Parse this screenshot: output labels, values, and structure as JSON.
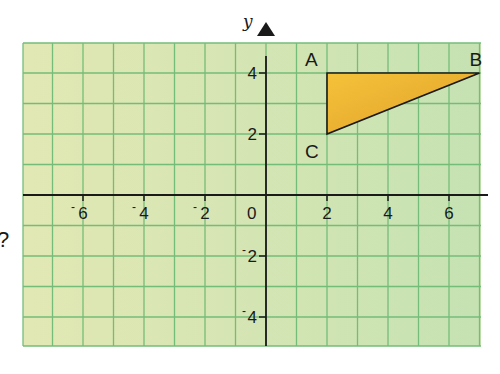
{
  "diagram": {
    "axis_label_y": "y",
    "margin_mark": "?",
    "x_ticks": [
      {
        "value": -6,
        "label": "6",
        "neg": true
      },
      {
        "value": -4,
        "label": "4",
        "neg": true
      },
      {
        "value": -2,
        "label": "2",
        "neg": true
      },
      {
        "value": 2,
        "label": "2",
        "neg": false
      },
      {
        "value": 4,
        "label": "4",
        "neg": false
      },
      {
        "value": 6,
        "label": "6",
        "neg": false
      }
    ],
    "y_ticks": [
      {
        "value": 4,
        "label": "4",
        "neg": false
      },
      {
        "value": 2,
        "label": "2",
        "neg": false
      },
      {
        "value": -2,
        "label": "2",
        "neg": true
      },
      {
        "value": -4,
        "label": "4",
        "neg": true
      }
    ],
    "origin_label": "0",
    "triangle": {
      "vertices": [
        {
          "name": "A",
          "x": 2,
          "y": 4
        },
        {
          "name": "B",
          "x": 7,
          "y": 4
        },
        {
          "name": "C",
          "x": 2,
          "y": 2
        }
      ],
      "fill": "#f0b830"
    },
    "grid": {
      "xmin": -8,
      "xmax": 7,
      "ymin": -5,
      "ymax": 5
    },
    "colors": {
      "grid_line": "#74bd78",
      "bg_left": "#e2e8b4",
      "bg_right": "#c6e2b2",
      "axis": "#1a1a1a"
    }
  }
}
